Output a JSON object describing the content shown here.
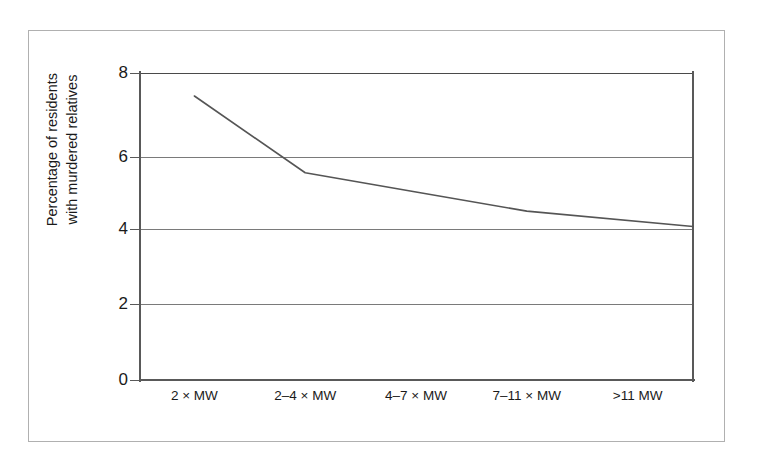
{
  "figure": {
    "frame_border_color": "#b0b0b0",
    "background_color": "#ffffff"
  },
  "chart_data": {
    "type": "line",
    "title": "",
    "subtitle": "",
    "xlabel": "",
    "ylabel": "Percentage of residents with murdered relatives",
    "ylabel_line1": "Percentage of residents",
    "ylabel_line2": "with murdered relatives",
    "categories": [
      "2 × MW",
      "2–4 × MW",
      "4–7 × MW",
      "7–11 × MW",
      ">11 MW"
    ],
    "series": [
      {
        "name": "Percentage of residents with murdered relatives",
        "values": [
          7.4,
          5.4,
          4.9,
          4.4,
          4.0
        ],
        "color": "#555555",
        "line_width": 1.6
      }
    ],
    "ylim": [
      0,
      8
    ],
    "yticks": [
      0,
      2,
      4,
      6,
      8
    ],
    "ytick_labels": [
      "0",
      "2",
      "4",
      "6",
      "8"
    ],
    "grid": true,
    "grid_axis": "y",
    "grid_color": "#7a7a7a",
    "legend": false,
    "legend_position": "none",
    "axis_color": "#595959",
    "text_color": "#1a1a1a"
  }
}
